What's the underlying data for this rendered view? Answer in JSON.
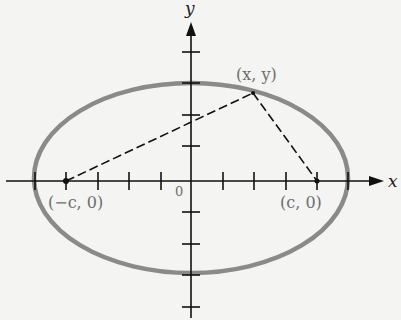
{
  "diagram": {
    "type": "ellipse-foci",
    "axes": {
      "x_label": "x",
      "y_label": "y",
      "origin_label": "0",
      "x_ticks_each_side": 5,
      "y_ticks_each_side": 4
    },
    "ellipse": {
      "semi_major_ticks": 5,
      "semi_minor_ticks": 3,
      "stroke_color": "#8a8a8a"
    },
    "points": {
      "focus_left": "(−c, 0)",
      "focus_right": "(c, 0)",
      "point_on_curve": "(x, y)"
    },
    "colors": {
      "background": "#f4f4f2",
      "axis": "#111111",
      "label": "#6e6e6e"
    }
  }
}
